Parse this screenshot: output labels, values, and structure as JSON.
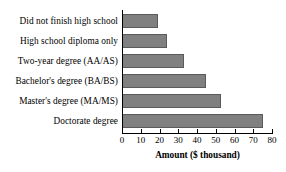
{
  "chart_data": {
    "type": "bar",
    "orientation": "horizontal",
    "title": "",
    "xlabel": "Amount ($ thousand)",
    "ylabel": "",
    "categories": [
      "Did not finish high school",
      "High school diploma only",
      "Two-year degree (AA/AS)",
      "Bachelor's degree (BA/BS)",
      "Master's degree (MA/MS)",
      "Doctorate degree"
    ],
    "values": [
      19,
      24,
      33,
      45,
      53,
      75
    ],
    "xlim": [
      0,
      80
    ],
    "xticks": [
      0,
      10,
      20,
      30,
      40,
      50,
      60,
      70,
      80
    ],
    "xtick_labels": [
      "0",
      "10",
      "20",
      "30",
      "40",
      "50",
      "60",
      "70",
      "80"
    ],
    "grid": false,
    "legend": false,
    "bar_color": "#808080",
    "bar_edge_color": "#5a5a5a",
    "background_color": "#ffffff",
    "axis_color": "#000000"
  }
}
